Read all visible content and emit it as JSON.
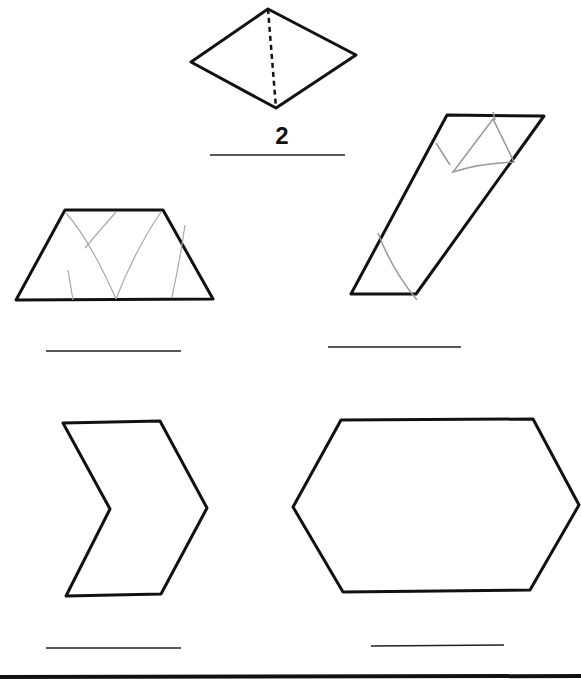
{
  "worksheet": {
    "shapes": [
      {
        "id": "rhombus",
        "description": "Rhombus split into 2 triangles by dashed line",
        "answer": "2"
      },
      {
        "id": "trapezoid",
        "description": "Trapezoid with faint pencil lines",
        "answer": ""
      },
      {
        "id": "parallelogram",
        "description": "Tall parallelogram with faint pencil lines",
        "answer": ""
      },
      {
        "id": "chevron",
        "description": "Chevron / arrow shape",
        "answer": ""
      },
      {
        "id": "hexagon",
        "description": "Elongated hexagon",
        "answer": ""
      }
    ]
  },
  "colors": {
    "ink": "#111111",
    "pencil": "#9a9a9a",
    "paper": "#ffffff"
  }
}
